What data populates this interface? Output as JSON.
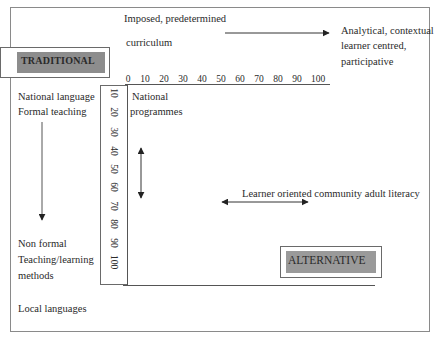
{
  "diagram": {
    "type": "quadrant-continuum",
    "labels": {
      "traditional": "TRADITIONAL",
      "alternative": "ALTERNATIVE"
    },
    "top_axis": {
      "left_text": [
        "Imposed, predetermined",
        "curriculum"
      ],
      "right_text": [
        "Analytical, contextual",
        "learner centred,",
        "participative"
      ],
      "ticks": [
        "0",
        "10",
        "20",
        "30",
        "40",
        "50",
        "60",
        "70",
        "80",
        "90",
        "100"
      ]
    },
    "left_axis": {
      "top_text": [
        "National language",
        "Formal teaching"
      ],
      "bottom_text": [
        "Non formal",
        "Teaching/learning",
        "methods"
      ],
      "bottom_footer": "Local languages",
      "ticks": [
        "10",
        "20",
        "30",
        "40",
        "50",
        "60",
        "70",
        "80",
        "90",
        "100"
      ]
    },
    "annotations": {
      "national_programmes": [
        "National",
        "programmes"
      ],
      "learner_oriented": "Learner oriented community adult literacy"
    },
    "colors": {
      "box_fill_traditional": "#8d8d8d",
      "box_fill_alternative": "#9a9a9a",
      "line": "#555555",
      "frame": "#8a8a8a"
    }
  }
}
